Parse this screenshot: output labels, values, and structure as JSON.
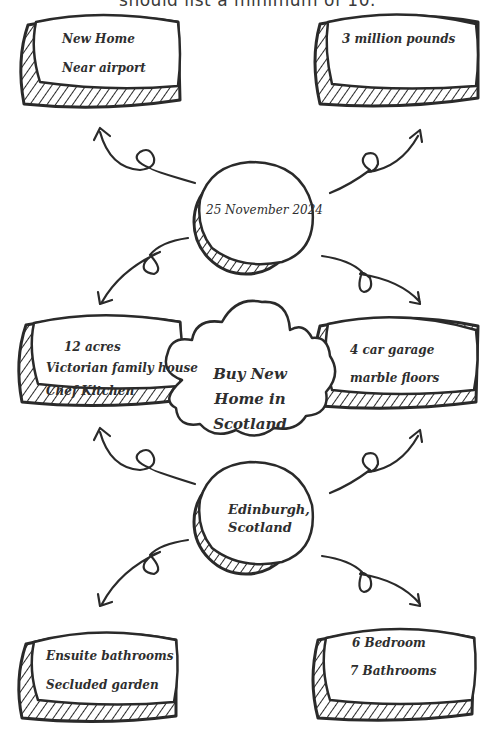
{
  "header": {
    "partial_text": "should list a minimum of 10."
  },
  "center": {
    "title_lines": [
      "Buy New",
      "Home in",
      "Scotland"
    ]
  },
  "hubs": [
    {
      "id": "date",
      "text": "25 November 2024"
    },
    {
      "id": "location",
      "lines": [
        "Edinburgh,",
        "Scotland"
      ]
    }
  ],
  "boxes": {
    "top_left": [
      "New Home",
      "Near airport"
    ],
    "top_right": [
      "3 million pounds"
    ],
    "mid_left": [
      "12 acres",
      "Victorian family house",
      "Chef Kitchen"
    ],
    "mid_right": [
      "4 car garage",
      "marble floors"
    ],
    "bottom_left": [
      "Ensuite bathrooms",
      "Secluded garden"
    ],
    "bottom_right": [
      "6 Bedroom",
      "7 Bathrooms"
    ]
  },
  "colors": {
    "stroke": "#2a2a2a",
    "text": "#2e2e2e",
    "background": "#ffffff"
  }
}
